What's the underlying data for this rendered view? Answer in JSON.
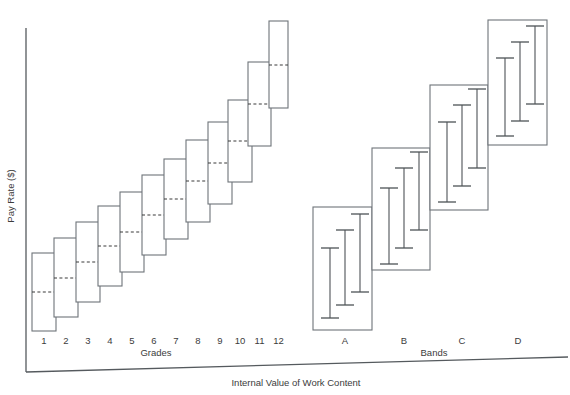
{
  "chart_data": {
    "type": "bar",
    "title": "",
    "subtitle": "",
    "xlabel": "Internal Value of Work Content",
    "ylabel": "Pay Rate ($)",
    "grades_axis_label": "Grades",
    "bands_axis_label": "Bands",
    "grid": false,
    "legend": false,
    "xlim": [
      0,
      570
    ],
    "ylim": [
      0,
      395
    ],
    "categories": [
      "1",
      "2",
      "3",
      "4",
      "5",
      "6",
      "7",
      "8",
      "9",
      "10",
      "11",
      "12"
    ],
    "grade_tick_labels": [
      "1",
      "2",
      "3",
      "4",
      "5",
      "6",
      "7",
      "8",
      "9",
      "10",
      "11",
      "12"
    ],
    "band_tick_labels": [
      "A",
      "B",
      "C",
      "D"
    ],
    "grades": [
      {
        "label": "1",
        "x": 32,
        "w": 24,
        "top": 253,
        "bottom": 331,
        "mid": 292
      },
      {
        "label": "2",
        "x": 54,
        "w": 24,
        "top": 238,
        "bottom": 317,
        "mid": 278
      },
      {
        "label": "3",
        "x": 76,
        "w": 24,
        "top": 222,
        "bottom": 302,
        "mid": 262
      },
      {
        "label": "4",
        "x": 98,
        "w": 24,
        "top": 206,
        "bottom": 286,
        "mid": 246
      },
      {
        "label": "5",
        "x": 120,
        "w": 24,
        "top": 192,
        "bottom": 272,
        "mid": 232
      },
      {
        "label": "6",
        "x": 142,
        "w": 24,
        "top": 175,
        "bottom": 255,
        "mid": 215
      },
      {
        "label": "7",
        "x": 164,
        "w": 24,
        "top": 159,
        "bottom": 239,
        "mid": 199
      },
      {
        "label": "8",
        "x": 186,
        "w": 24,
        "top": 140,
        "bottom": 222,
        "mid": 181
      },
      {
        "label": "9",
        "x": 208,
        "w": 24,
        "top": 122,
        "bottom": 204,
        "mid": 163
      },
      {
        "label": "10",
        "x": 228,
        "w": 24,
        "top": 100,
        "bottom": 182,
        "mid": 141
      },
      {
        "label": "11",
        "x": 248,
        "w": 23,
        "top": 62,
        "bottom": 146,
        "mid": 104
      },
      {
        "label": "12",
        "x": 269,
        "w": 19,
        "top": 21,
        "bottom": 108,
        "mid": 65
      }
    ],
    "bands": [
      {
        "label": "A",
        "x": 313,
        "w": 59,
        "top": 207,
        "bottom": 330,
        "label_x": 345,
        "beams": [
          {
            "x": 330,
            "top": 248,
            "bottom": 318
          },
          {
            "x": 345,
            "top": 230,
            "bottom": 305
          },
          {
            "x": 360,
            "top": 214,
            "bottom": 292
          }
        ]
      },
      {
        "label": "B",
        "x": 372,
        "w": 58,
        "top": 148,
        "bottom": 270,
        "label_x": 404,
        "beams": [
          {
            "x": 389,
            "top": 188,
            "bottom": 264
          },
          {
            "x": 404,
            "top": 168,
            "bottom": 248
          },
          {
            "x": 419,
            "top": 152,
            "bottom": 230
          }
        ]
      },
      {
        "label": "C",
        "x": 430,
        "w": 58,
        "top": 85,
        "bottom": 210,
        "label_x": 462,
        "beams": [
          {
            "x": 447,
            "top": 122,
            "bottom": 202
          },
          {
            "x": 462,
            "top": 105,
            "bottom": 186
          },
          {
            "x": 477,
            "top": 89,
            "bottom": 168
          }
        ]
      },
      {
        "label": "D",
        "x": 488,
        "w": 59,
        "top": 20,
        "bottom": 145,
        "label_x": 518,
        "beams": [
          {
            "x": 505,
            "top": 58,
            "bottom": 136
          },
          {
            "x": 520,
            "top": 42,
            "bottom": 121
          },
          {
            "x": 535,
            "top": 26,
            "bottom": 104
          }
        ]
      }
    ],
    "axes": {
      "y_axis": {
        "x": 26,
        "top": 28,
        "bottom": 372
      },
      "x_axis": {
        "x1": 26,
        "y1": 372,
        "x2": 568,
        "y2": 357
      }
    },
    "colors": {
      "background": "#ffffff",
      "box_stroke": "#6e7479",
      "axis_stroke": "#555a5e",
      "beam_stroke": "#4d5256",
      "dash_stroke": "#3a3a3a",
      "text": "#3c3c3c"
    }
  },
  "labels": {
    "y_axis_title": "Pay Rate ($)",
    "x_axis_title": "Internal Value of Work Content",
    "grades_title": "Grades",
    "bands_title": "Bands"
  },
  "positions": {
    "grades_title_x": 156,
    "grades_title_y": 356,
    "bands_title_x": 434,
    "bands_title_y": 356,
    "grade_tick_y": 344,
    "band_tick_y": 344,
    "x_axis_title_x": 296,
    "x_axis_title_y": 386,
    "y_axis_title_x": 14,
    "y_axis_title_y": 196
  }
}
